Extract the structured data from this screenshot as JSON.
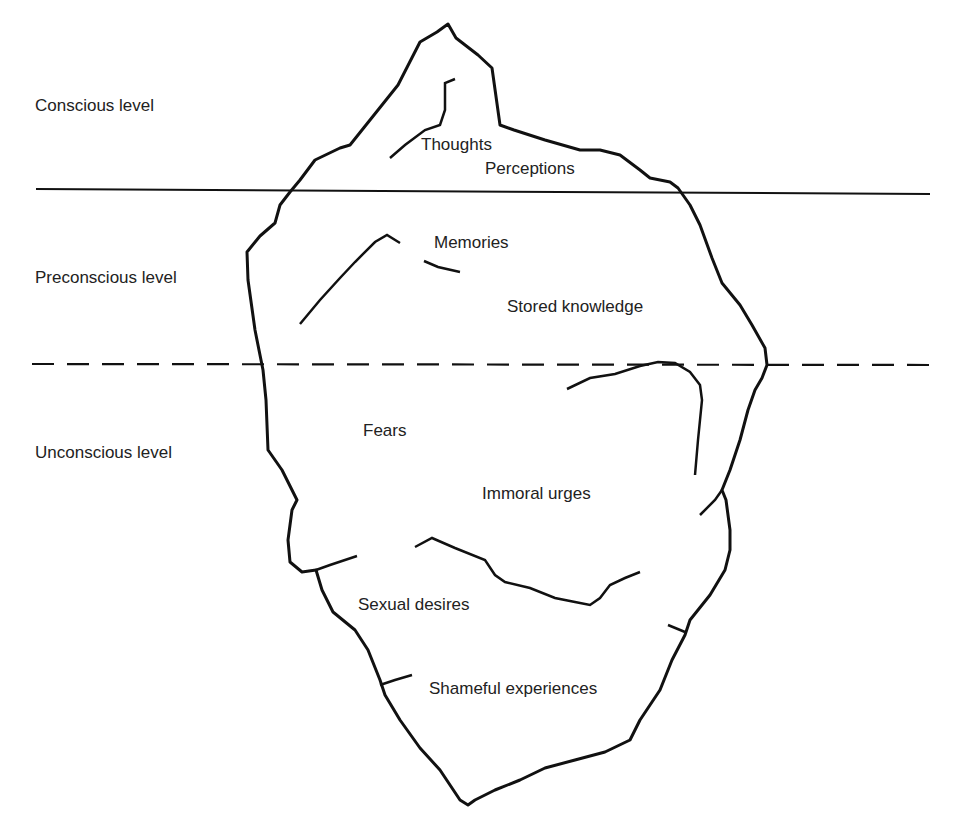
{
  "diagram": {
    "type": "iceberg model of mind",
    "levels": [
      {
        "label": "Conscious level",
        "boundary": "solid line"
      },
      {
        "label": "Preconscious level",
        "boundary": "dashed line"
      },
      {
        "label": "Unconscious level"
      }
    ],
    "contents": {
      "conscious": [
        "Thoughts",
        "Perceptions"
      ],
      "preconscious": [
        "Memories",
        "Stored knowledge"
      ],
      "unconscious": [
        "Fears",
        "Immoral urges",
        "Sexual desires",
        "Shameful experiences"
      ]
    },
    "colors": {
      "line": "#111111",
      "text": "#222222",
      "background": "#ffffff"
    }
  }
}
